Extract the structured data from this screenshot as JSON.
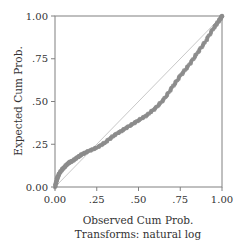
{
  "chart_data": {
    "type": "scatter",
    "title": "",
    "xlabel": "Observed Cum Prob.",
    "xlabel_sub": "Transforms: natural log",
    "ylabel": "Expected Cum Prob.",
    "xlim": [
      0,
      1
    ],
    "ylim": [
      0,
      1
    ],
    "grid": false,
    "x_ticks": [
      "0.00",
      ".25",
      ".50",
      ".75",
      "1.00"
    ],
    "y_ticks": [
      "0.00",
      ".25",
      ".50",
      ".75",
      "1.00"
    ],
    "reference_line": {
      "from": [
        0,
        0
      ],
      "to": [
        1,
        1
      ]
    },
    "series": [
      {
        "name": "P-P points",
        "x": [
          0.0,
          0.01,
          0.02,
          0.04,
          0.06,
          0.08,
          0.1,
          0.13,
          0.16,
          0.2,
          0.25,
          0.3,
          0.35,
          0.4,
          0.45,
          0.5,
          0.55,
          0.6,
          0.65,
          0.7,
          0.75,
          0.8,
          0.85,
          0.9,
          0.95,
          0.98,
          1.0
        ],
        "y": [
          0.0,
          0.04,
          0.07,
          0.1,
          0.12,
          0.14,
          0.15,
          0.17,
          0.19,
          0.21,
          0.23,
          0.26,
          0.3,
          0.33,
          0.36,
          0.39,
          0.42,
          0.46,
          0.51,
          0.58,
          0.65,
          0.71,
          0.78,
          0.85,
          0.93,
          0.97,
          1.0
        ]
      }
    ]
  },
  "colors": {
    "points": "#8c8c8c",
    "reference": "#c8c8c8",
    "axis": "#808080"
  }
}
